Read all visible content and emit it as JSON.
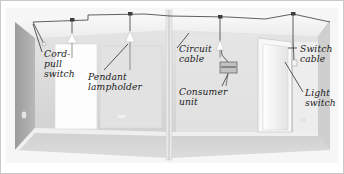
{
  "figure": {
    "style": "greyscale architectural illustration",
    "width": 344,
    "height": 174
  },
  "labels": [
    {
      "id": "cord-pull-switch",
      "text": "Cord-\npull\nswitch",
      "x": 44,
      "y": 49
    },
    {
      "id": "pendant-lampholder",
      "text": "Pendant\nlampholder",
      "x": 88,
      "y": 72
    },
    {
      "id": "circuit-cable",
      "text": "Circuit\ncable",
      "x": 179,
      "y": 44
    },
    {
      "id": "consumer-unit",
      "text": "Consumer\nunit",
      "x": 179,
      "y": 87
    },
    {
      "id": "switch-cable",
      "text": "Switch\ncable",
      "x": 300,
      "y": 44
    },
    {
      "id": "light-switch",
      "text": "Light\nswitch",
      "x": 305,
      "y": 88
    }
  ],
  "colors": {
    "wall_light": "#e9e9e9",
    "wall_mid": "#dcdcdc",
    "wall_shadow": "#a9a9a9",
    "ceiling": "#f2f2f2",
    "floor": "#d6d6d6",
    "cable": "#4a4a4a",
    "outline": "#8f8f8f",
    "label_text": "#1b1b1b",
    "border": "#c9c9c9"
  },
  "components": {
    "pendant_count": 3,
    "junction_box_count": 4,
    "consumer_unit_label": "consumer-unit-box",
    "door_count": 1
  }
}
